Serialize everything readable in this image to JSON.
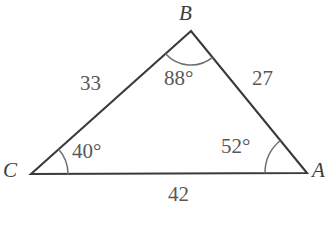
{
  "figure": {
    "kind": "triangle-diagram",
    "background_color": "#ffffff",
    "stroke_color": "#3a3a3a",
    "arc_color": "#6e6e6e",
    "text_color": "#585858",
    "vertices": {
      "A": {
        "label": "A",
        "x": 307,
        "y": 173
      },
      "B": {
        "label": "B",
        "x": 191,
        "y": 31
      },
      "C": {
        "label": "C",
        "x": 31,
        "y": 174
      }
    },
    "sides": [
      {
        "name": "side-CB",
        "label": "33",
        "from": "C",
        "to": "B"
      },
      {
        "name": "side-BA",
        "label": "27",
        "from": "B",
        "to": "A"
      },
      {
        "name": "side-CA",
        "label": "42",
        "from": "C",
        "to": "A"
      }
    ],
    "angles": [
      {
        "name": "angle-B",
        "label": "88°",
        "vertex": "B",
        "value": 88
      },
      {
        "name": "angle-C",
        "label": "40°",
        "vertex": "C",
        "value": 40
      },
      {
        "name": "angle-A",
        "label": "52°",
        "vertex": "A",
        "value": 52
      }
    ]
  }
}
